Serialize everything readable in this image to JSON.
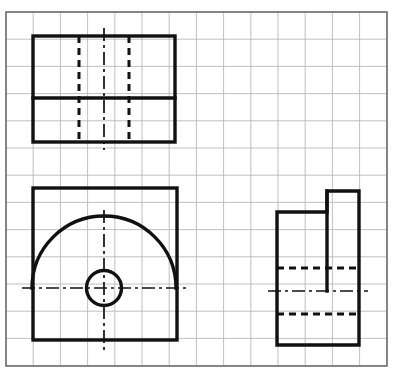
{
  "canvas": {
    "width": 401,
    "height": 381,
    "background": "#ffffff",
    "title": "Orthographic Multiview Engineering Drawing on Grid Paper"
  },
  "grid": {
    "name": "graph-paper-grid",
    "cell_size": 27.2,
    "line_color": "#b9b9b9",
    "line_width": 0.9,
    "origin_x": 6,
    "origin_y": 12,
    "columns": 14,
    "rows": 13,
    "frame": {
      "x": 6,
      "y": 12,
      "width": 381,
      "height": 354,
      "color": "#6f6f6f",
      "line_width": 1.6
    }
  },
  "style": {
    "object_line_color": "#111111",
    "object_line_width": 3.4,
    "hidden_line_color": "#111111",
    "hidden_line_width": 3.0,
    "hidden_dash": "7,5",
    "center_line_color": "#111111",
    "center_line_width": 1.7,
    "center_dash": "13,4,3,4"
  },
  "views": {
    "top_view": {
      "label": "Top View",
      "name": "top-view",
      "outline": {
        "x": 33,
        "y": 36,
        "width": 142,
        "height": 106
      },
      "solid_lines": [
        {
          "name": "horizontal-division-line",
          "x1": 33,
          "y1": 98,
          "x2": 175,
          "y2": 98
        }
      ],
      "hidden_lines": [
        {
          "name": "hidden-line-left",
          "x1": 79,
          "y1": 36,
          "x2": 79,
          "y2": 142
        },
        {
          "name": "hidden-line-right",
          "x1": 129,
          "y1": 36,
          "x2": 129,
          "y2": 142
        }
      ],
      "center_lines": [
        {
          "name": "vertical-center-line",
          "x1": 104,
          "y1": 28,
          "x2": 104,
          "y2": 150
        }
      ]
    },
    "front_view": {
      "label": "Front View",
      "name": "front-view",
      "outline": {
        "x": 33,
        "y": 188,
        "width": 144,
        "height": 152
      },
      "semicircle": {
        "name": "semicircular-arc",
        "center_x": 104,
        "center_y": 288,
        "radius": 72,
        "start_angle": 180,
        "end_angle": 360,
        "description": "upper half arc from left to right"
      },
      "circle": {
        "name": "hole-circle",
        "center_x": 104,
        "center_y": 288,
        "radius": 17.5
      },
      "center_lines": [
        {
          "name": "horizontal-center-line",
          "x1": 22,
          "y1": 288,
          "x2": 188,
          "y2": 288
        },
        {
          "name": "vertical-center-line",
          "x1": 104,
          "y1": 210,
          "x2": 104,
          "y2": 350
        }
      ]
    },
    "side_view": {
      "label": "Right Side View",
      "name": "side-view",
      "outline_points": "277,212 327,212 327,191 359,191 359,345 277,345",
      "outline_path": "M 277 212 L 327 212 L 327 191 L 359 191 L 359 345 L 277 345 Z",
      "hidden_lines": [
        {
          "name": "hidden-line-upper",
          "x1": 277,
          "y1": 268,
          "x2": 359,
          "y2": 268
        },
        {
          "name": "hidden-line-lower",
          "x1": 277,
          "y1": 314,
          "x2": 359,
          "y2": 314
        }
      ],
      "center_lines": [
        {
          "name": "horizontal-center-line",
          "x1": 268,
          "y1": 291,
          "x2": 368,
          "y2": 291
        }
      ],
      "solid_lines": [
        {
          "name": "step-vertical-edge",
          "x1": 327,
          "y1": 191,
          "x2": 327,
          "y2": 291
        }
      ]
    }
  }
}
